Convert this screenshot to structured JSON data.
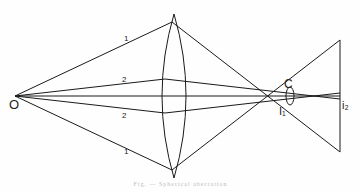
{
  "diagram": {
    "type": "optics-ray-diagram",
    "labels": {
      "object_point": "O",
      "ray_1_upper": "1",
      "ray_1_lower": "1",
      "ray_2_upper": "2",
      "ray_2_lower": "2",
      "circle_of_least_confusion": "C",
      "image_marginal": "I1",
      "image_marginal_display": "I₁",
      "image_paraxial": "i2",
      "image_paraxial_display": "i₂"
    },
    "caption": "Fig. — Spherical aberration",
    "colors": {
      "line": "#1a1a1a",
      "background": "#fefefe",
      "caption": "#bbbbbb"
    }
  }
}
